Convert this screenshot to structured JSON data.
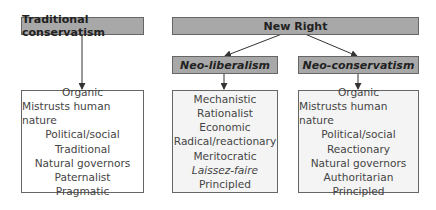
{
  "nodes": {
    "traditional": {
      "title": "Traditional conservatism",
      "traits": [
        "Organic",
        "Mistrusts human nature",
        "Political/social",
        "Traditional",
        "Natural governors",
        "Paternalist",
        "Pragmatic"
      ]
    },
    "new_right": {
      "title": "New Right"
    },
    "neo_liberalism": {
      "title": "Neo-liberalism",
      "traits": [
        "Mechanistic",
        "Rationalist",
        "Economic",
        "Radical/reactionary",
        "Meritocratic",
        "Laissez-faire",
        "Principled"
      ]
    },
    "neo_conservatism": {
      "title": "Neo-conservatism",
      "traits": [
        "Organic",
        "Mistrusts human nature",
        "Political/social",
        "Reactionary",
        "Natural governors",
        "Authoritarian",
        "Principled"
      ]
    }
  },
  "edges": [
    {
      "from": "traditional",
      "to": "traditional-traits"
    },
    {
      "from": "new_right",
      "to": "neo_liberalism"
    },
    {
      "from": "new_right",
      "to": "neo_conservatism"
    },
    {
      "from": "neo_liberalism",
      "to": "neo_liberalism-traits"
    },
    {
      "from": "neo_conservatism",
      "to": "neo_conservatism-traits"
    }
  ],
  "colors": {
    "header_fill": "#a8a8a8",
    "border": "#666666",
    "text": "#444444"
  }
}
